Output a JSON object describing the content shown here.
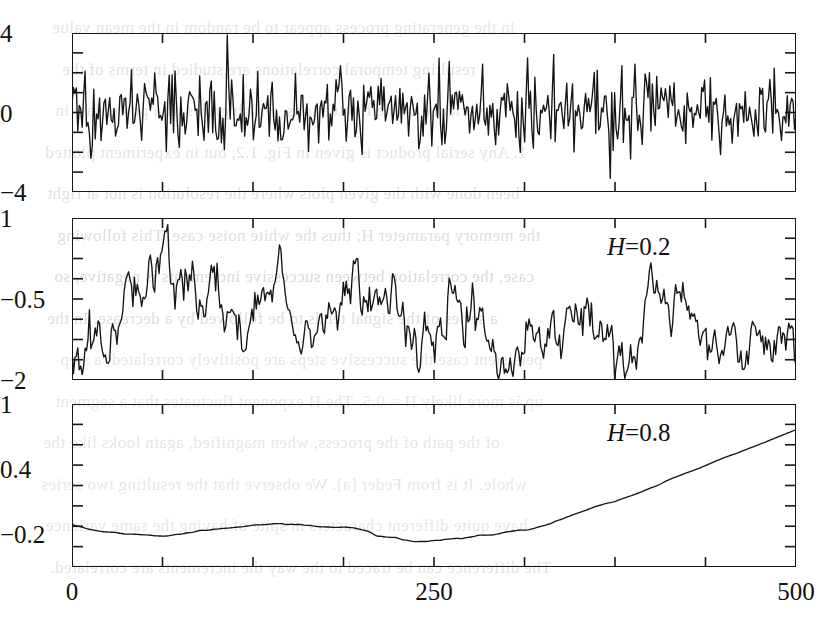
{
  "figure": {
    "kind": "multi-panel-time-series",
    "panel_count": 3,
    "background_color": "#ffffff",
    "trace_color": "#151515",
    "axis_color": "#171717"
  },
  "bleed_text": {
    "description": "faint mirrored show-through text from the reverse side of the scanned book page",
    "lines": [
      "in the generating process appear to be random in the mean value",
      "resulting temporal correlations are studied in terms of the",
      "variance of the fluctuations, which grows as a power law in",
      "1. Any serial product is given in Fig. 1.2, but in experiment plotted",
      "been done with the given plots where the resolution is not at right",
      "the memory parameter H; thus the white noise case. This following",
      "case, the correlation between successive increments is negative, so",
      "a series of the signal tends to be followed by a decrease. In the",
      "persistent case the successive steps are positively correlated; a step",
      "up is more likely H = 0.5. The H exponent fluctuates that a segment",
      "of the path of the process, when magnified, again looks like the",
      "whole. It is from Feder [a]. We observe that the resulting two series",
      "have quite different characters in spite of having the same variance.",
      "The difference can be traced to the way the increments are correlated."
    ]
  },
  "panels": [
    {
      "id": "panel-white-noise",
      "name": "white-noise",
      "annotation": null,
      "y_axis": {
        "labels": [
          "4",
          "0",
          "-4"
        ],
        "values": [
          4,
          0,
          -4
        ],
        "min": -4,
        "max": 4,
        "minor_tick_step": 1
      },
      "x_axis": {
        "min": 0,
        "max": 500,
        "labels_visible": false,
        "tick_step": 62.5
      },
      "series_description": "uncorrelated Gaussian white noise, mean 0, std ~1"
    },
    {
      "id": "panel-antipersistent",
      "name": "fractional-brownian-H-0.2",
      "annotation": {
        "symbol": "H",
        "operator": "=",
        "value": "0.2"
      },
      "y_axis": {
        "labels": [
          "1",
          "-0.5",
          "-2"
        ],
        "values": [
          1,
          -0.5,
          -2
        ],
        "min": -2,
        "max": 1,
        "minor_tick_step": 0.375
      },
      "x_axis": {
        "min": 0,
        "max": 500,
        "labels_visible": false,
        "tick_step": 62.5
      },
      "series_description": "anti-persistent fractional Brownian motion, Hurst exponent 0.2, rough jagged path"
    },
    {
      "id": "panel-persistent",
      "name": "fractional-brownian-H-0.8",
      "annotation": {
        "symbol": "H",
        "operator": "=",
        "value": "0.8"
      },
      "y_axis": {
        "labels": [
          "1",
          "0.4",
          "-0.2"
        ],
        "values": [
          1,
          0.4,
          -0.2
        ],
        "min": -0.5,
        "max": 1,
        "minor_tick_step": 0.1875
      },
      "x_axis": {
        "min": 0,
        "max": 500,
        "labels": [
          "0",
          "250",
          "500"
        ],
        "label_values": [
          0,
          250,
          500
        ],
        "labels_visible": true,
        "tick_step": 62.5
      },
      "series_description": "persistent fractional Brownian motion, Hurst exponent 0.8, smooth rising trend"
    }
  ],
  "chart_data": {
    "type": "line",
    "title": "",
    "xlabel": "",
    "ylabel": "",
    "shared_x": {
      "min": 0,
      "max": 500,
      "ticks": [
        0,
        250,
        500
      ]
    },
    "panels": [
      {
        "name": "white noise",
        "ylim": [
          -4,
          4
        ],
        "yticks": [
          4,
          0,
          -4
        ],
        "label": "",
        "n_points": 500,
        "generator": {
          "model": "gaussian-white-noise",
          "mean": 0,
          "std": 0.95,
          "seed": 20411
        }
      },
      {
        "name": "H = 0.2",
        "ylim": [
          -2,
          1
        ],
        "yticks": [
          1,
          -0.5,
          -2
        ],
        "label": "H = 0.2",
        "n_points": 500,
        "generator": {
          "model": "fractional-brownian-motion",
          "hurst": 0.2,
          "seed": 771,
          "start": -0.55,
          "end": -1.25,
          "range_hint": [
            -2.0,
            0.85
          ]
        }
      },
      {
        "name": "H = 0.8",
        "ylim": [
          -0.5,
          1
        ],
        "yticks": [
          1,
          0.4,
          -0.2
        ],
        "label": "H = 0.8",
        "n_points": 500,
        "generator": {
          "model": "fractional-brownian-motion",
          "hurst": 0.8,
          "seed": 9157,
          "start": -0.02,
          "end": 0.78,
          "min_at": [
            245,
            -0.37
          ],
          "range_hint": [
            -0.4,
            0.8
          ]
        }
      }
    ]
  }
}
